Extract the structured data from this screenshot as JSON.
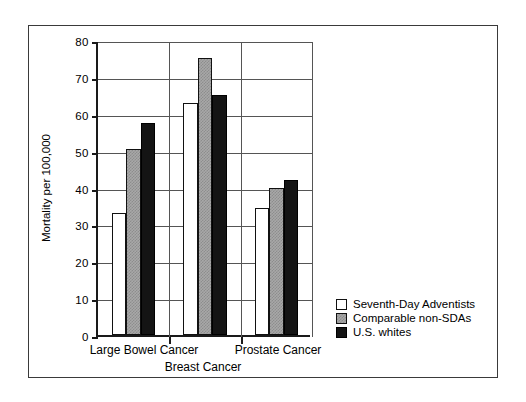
{
  "chart_data": {
    "type": "bar",
    "title": "",
    "xlabel": "",
    "ylabel": "Mortality per 100,000",
    "ylim": [
      0,
      80
    ],
    "yticks": [
      0,
      10,
      20,
      30,
      40,
      50,
      60,
      70,
      80
    ],
    "ytick_labels": [
      "0",
      "10",
      "20",
      "30",
      "40",
      "50",
      "60",
      "70",
      "80"
    ],
    "grid": true,
    "legend_position": "bottom-right-outside",
    "categories": [
      "Large Bowel Cancer",
      "Breast Cancer",
      "Prostate Cancer"
    ],
    "series": [
      {
        "name": "Seventh-Day Adventists",
        "color": "#ffffff",
        "fill": "white",
        "values": [
          33.0,
          63.0,
          34.5
        ]
      },
      {
        "name": "Comparable non-SDAs",
        "color": "#a8a8a8",
        "fill": "gray-dither",
        "values": [
          50.5,
          75.0,
          40.0
        ]
      },
      {
        "name": "U.S. whites",
        "color": "#141414",
        "fill": "black",
        "values": [
          57.5,
          65.0,
          42.0
        ]
      }
    ]
  },
  "axis": {
    "y_title": "Mortality per 100,000"
  },
  "legend": {
    "items": [
      {
        "label": "Seventh-Day Adventists",
        "fill": "white"
      },
      {
        "label": "Comparable non-SDAs",
        "fill": "gray"
      },
      {
        "label": "U.S. whites",
        "fill": "black"
      }
    ]
  },
  "category_labels": [
    {
      "text": "Large Bowel Cancer",
      "row": "top"
    },
    {
      "text": "Breast Cancer",
      "row": "bottom"
    },
    {
      "text": "Prostate Cancer",
      "row": "top"
    }
  ]
}
